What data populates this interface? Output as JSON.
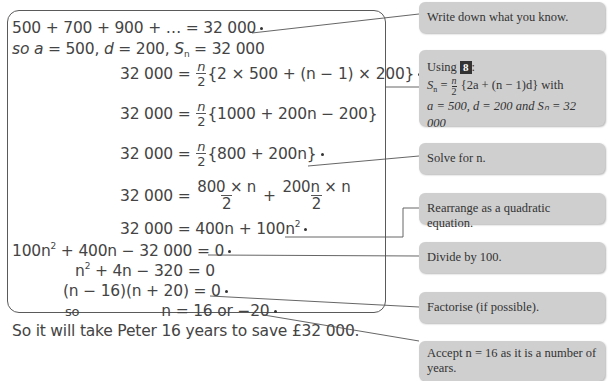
{
  "working": {
    "line1": "500 + 700 + 900 + … = 32 000",
    "line2_prefix": "so",
    "line2_a": "a",
    "line2_a_val": " = 500, ",
    "line2_d": "d",
    "line2_d_val": " = 200, ",
    "line2_S": "S",
    "line2_sub": "n",
    "line2_S_val": " = 32 000",
    "lhs": "32 000 =",
    "n": "n",
    "two": "2",
    "eq3_body": "{2 × 500 + (n − 1) × 200}",
    "eq4_body": "{1000 + 200n − 200}",
    "eq5_body": "{800 + 200n}",
    "eq6_num1": "800 × n",
    "eq6_plus": "+",
    "eq6_num2": "200n × n",
    "eq7_body": "400n + 100n",
    "sq": "2",
    "eq8_a": "100n",
    "eq8_b": " + 400n − 32 000 = 0",
    "eq9_a": "n",
    "eq9_b": " + 4n − 320 = 0",
    "eq10": "(n − 16)(n + 20) = 0",
    "eq11_so": "so",
    "eq11": "n = 16 or −20",
    "conclusion": "So it will take Peter 16 years to save £32 000."
  },
  "callouts": {
    "c1": "Write down what you know.",
    "c2_using": "Using",
    "c2_badge": "8",
    "c2_colon": ":",
    "c2_formula_S": "S",
    "c2_formula_sub": "n",
    "c2_formula_eq": " = ",
    "c2_formula_n": "n",
    "c2_formula_2": "2",
    "c2_formula_body": "{2a + (n − 1)d} with",
    "c2_line3": "a = 500, d = 200 and Sₙ = 32 000",
    "c3": "Solve for n.",
    "c4": "Rearrange as a quadratic equation.",
    "c5": "Divide by 100.",
    "c6": "Factorise (if possible).",
    "c7": "Accept n = 16 as it is a number of years."
  },
  "colors": {
    "callout_bg": "#cfcfcf",
    "border": "#5a5a5a",
    "text": "#444444"
  }
}
